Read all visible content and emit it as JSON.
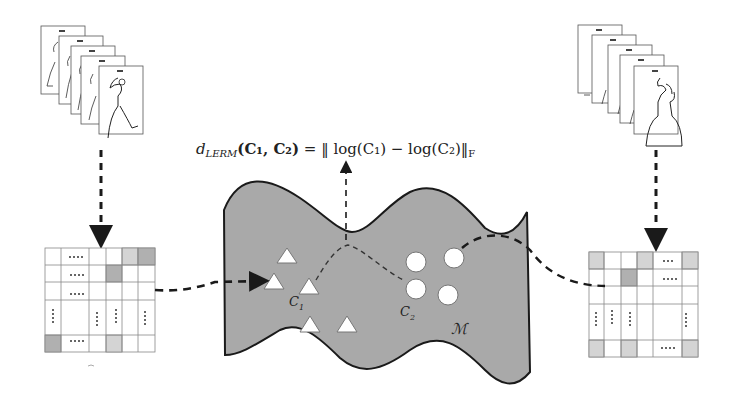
{
  "formula": {
    "lhs_symbol": "d",
    "lhs_subscript": "LERM",
    "lhs_args": "(C₁, C₂)",
    "equals": "=",
    "rhs": "‖ log(C₁) − log(C₂)‖",
    "rhs_subscript": "F"
  },
  "labels": {
    "c1": "C",
    "c1_sub": "1",
    "c2": "C",
    "c2_sub": "2",
    "manifold": "ℳ"
  },
  "left_stack": {
    "frames": 5,
    "description": "stacked sketch frames"
  },
  "right_stack": {
    "frames": 5,
    "description": "stacked sketch frames"
  },
  "left_matrix": {
    "rows": 5,
    "cols": 6,
    "shaded_cells": [
      [
        0,
        4,
        "light"
      ],
      [
        0,
        5,
        "dark"
      ],
      [
        1,
        3,
        "dark"
      ],
      [
        4,
        0,
        "dark"
      ],
      [
        4,
        3,
        "light"
      ]
    ]
  },
  "right_matrix": {
    "rows": 5,
    "cols": 6,
    "shaded_cells": [
      [
        0,
        0,
        "light"
      ],
      [
        0,
        3,
        "light"
      ],
      [
        0,
        5,
        "light"
      ],
      [
        1,
        2,
        "dark"
      ],
      [
        4,
        0,
        "light"
      ],
      [
        4,
        2,
        "light"
      ],
      [
        4,
        5,
        "light"
      ]
    ]
  },
  "colors": {
    "manifold_fill": "#a9a9a9",
    "stroke": "#1a1a1a",
    "light_cell": "#d4d4d4",
    "dark_cell": "#b0b0b0"
  }
}
